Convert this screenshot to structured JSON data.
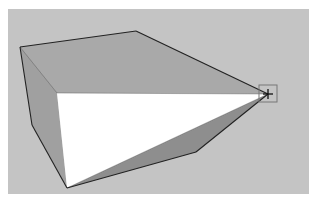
{
  "scene": {
    "description": "3D modeling viewport with extruded pyramid-like solid and move/inference cursor at apex",
    "colors": {
      "background": "#c4c4c4",
      "face_top": "#a9a9a9",
      "face_left": "#a0a0a0",
      "face_front": "#ffffff",
      "face_bottom": "#8e8e8e",
      "edge": "#222222",
      "cursor_box": "#777777"
    },
    "faces": {
      "top": "20,47 136,31 268,94 57,93",
      "left": "20,47 57,93 67,188 32,125",
      "front": "57,93 268,94 67,188",
      "bottom": "67,188 268,94 196,152"
    },
    "edges": [
      "20,47 136,31",
      "136,31 268,94",
      "20,47 32,125",
      "32,125 67,188",
      "67,188 196,152",
      "196,152 268,94",
      "57,93 268,94",
      "20,47 57,93",
      "67,188 268,94"
    ],
    "cursor": {
      "icon": "move-crosshair-icon",
      "x": 268,
      "y": 94,
      "box": [
        259,
        85,
        18,
        17
      ]
    }
  }
}
